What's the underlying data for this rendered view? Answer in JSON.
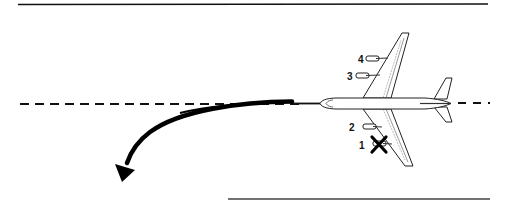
{
  "diagram": {
    "type": "aircraft-engine-failure-yaw",
    "runway": {
      "edge_color": "#111111",
      "centerline_color": "#111111"
    },
    "aircraft": {
      "fill": "#ffffff",
      "stroke": "#222222"
    },
    "engines": [
      {
        "label": "4",
        "failed": false
      },
      {
        "label": "3",
        "failed": false
      },
      {
        "label": "2",
        "failed": false
      },
      {
        "label": "1",
        "failed": true,
        "failure_mark": "X"
      }
    ],
    "yaw_arrow": {
      "color": "#000000",
      "direction": "left-turn"
    }
  }
}
